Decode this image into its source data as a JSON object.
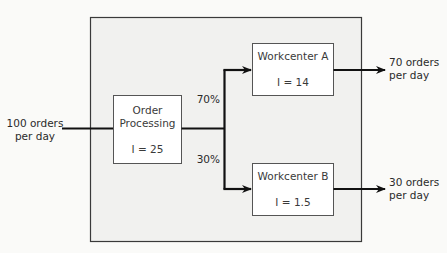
{
  "diagram": {
    "outer_box": {
      "fill": "#f1f1ef",
      "stroke": "#3a3a3a"
    },
    "input": {
      "line1": "100 orders",
      "line2": "per day"
    },
    "order_processing": {
      "line1": "Order",
      "line2": "Processing",
      "inventory": "I = 25"
    },
    "split": {
      "upper_pct": "70%",
      "lower_pct": "30%"
    },
    "workcenter_a": {
      "title": "Workcenter A",
      "inventory": "I = 14"
    },
    "workcenter_b": {
      "title": "Workcenter B",
      "inventory": "I = 1.5"
    },
    "output_a": {
      "line1": "70 orders",
      "line2": "per day"
    },
    "output_b": {
      "line1": "30 orders",
      "line2": "per day"
    }
  }
}
